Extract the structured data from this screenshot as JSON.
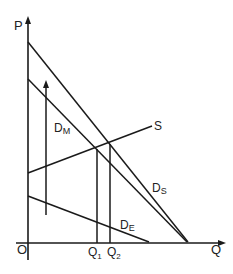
{
  "diagram": {
    "type": "supply-demand",
    "axes": {
      "y_label": "P",
      "x_label": "Q",
      "origin_label": "O"
    },
    "curves": {
      "demand_total": {
        "label": "D",
        "subscript": "S"
      },
      "demand_market": {
        "label": "D",
        "subscript": "M"
      },
      "supply": {
        "label": "S"
      },
      "demand_export": {
        "label": "D",
        "subscript": "E"
      }
    },
    "quantities": [
      {
        "label": "Q",
        "subscript": "1"
      },
      {
        "label": "Q",
        "subscript": "2"
      }
    ],
    "line_color": "#1a1a1a"
  }
}
